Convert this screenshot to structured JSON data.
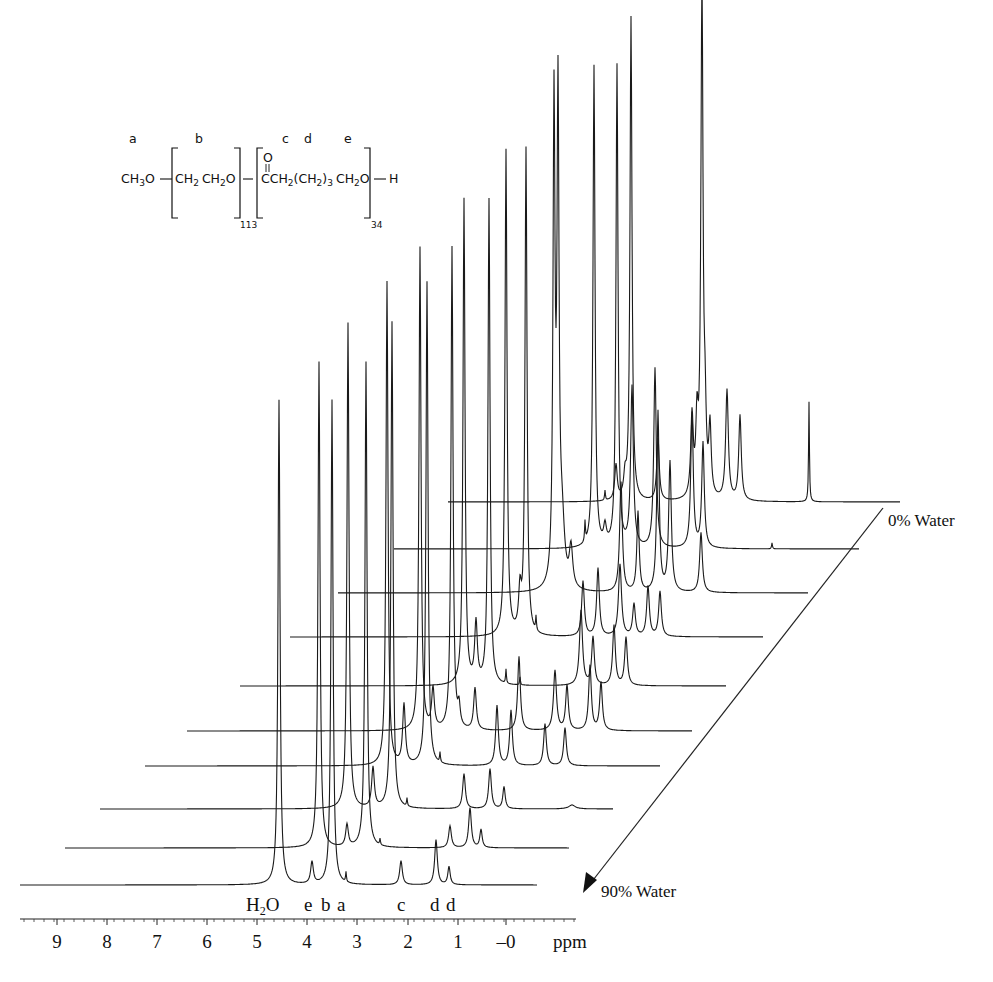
{
  "chart_data": {
    "type": "line",
    "subtype": "stacked-waterfall-nmr",
    "title": "",
    "xlabel": "ppm",
    "ylabel": "",
    "xlim": [
      9.75,
      -0.5
    ],
    "x_ticks": [
      9,
      8,
      7,
      6,
      5,
      4,
      3,
      2,
      1,
      0
    ],
    "x_tick_labels": [
      "9",
      "8",
      "7",
      "6",
      "5",
      "4",
      "3",
      "2",
      "1",
      "–0"
    ],
    "grid": false,
    "series_direction_label_top": "0% Water",
    "series_direction_label_bottom": "90% Water",
    "peak_assignments": [
      {
        "label": "H2O",
        "ppm": 4.6
      },
      {
        "label": "e",
        "ppm": 3.9
      },
      {
        "label": "b",
        "ppm": 3.6
      },
      {
        "label": "a",
        "ppm": 3.35
      },
      {
        "label": "c",
        "ppm": 2.2
      },
      {
        "label": "d",
        "ppm": 1.5
      },
      {
        "label": "d",
        "ppm": 1.3
      }
    ],
    "series": [
      {
        "name": "90% Water",
        "baseline": [
          20,
          885
        ],
        "end_x": 537,
        "peaks": [
          [
            279,
            485,
            1.2
          ],
          [
            312,
            22,
            1.6
          ],
          [
            332,
            485,
            1.2
          ],
          [
            346,
            10,
            0.5
          ],
          [
            401,
            24,
            1.6
          ],
          [
            436,
            45,
            1.6
          ],
          [
            449,
            18,
            1.4
          ]
        ]
      },
      {
        "name": "80% Water",
        "baseline": [
          65,
          848
        ],
        "end_x": 569,
        "peaks": [
          [
            319,
            486,
            1.2
          ],
          [
            347,
            22,
            1.6
          ],
          [
            366,
            486,
            1.2
          ],
          [
            380,
            6,
            0.5
          ],
          [
            450,
            22,
            1.6
          ],
          [
            470,
            40,
            1.6
          ],
          [
            481,
            18,
            1.4
          ]
        ]
      },
      {
        "name": "70% Water",
        "baseline": [
          100,
          809
        ],
        "end_x": 613,
        "peaks": [
          [
            348,
            486,
            1.2
          ],
          [
            373,
            40,
            1.6
          ],
          [
            392,
            487,
            1.2
          ],
          [
            407,
            8,
            0.5
          ],
          [
            464,
            35,
            1.6
          ],
          [
            490,
            40,
            1.6
          ],
          [
            504,
            22,
            1.4
          ],
          [
            572,
            4,
            4
          ]
        ]
      },
      {
        "name": "60% Water",
        "baseline": [
          145,
          766
        ],
        "end_x": 660,
        "peaks": [
          [
            387,
            484,
            1.2
          ],
          [
            404,
            60,
            1.6
          ],
          [
            427,
            484,
            1.2
          ],
          [
            440,
            10,
            0.5
          ],
          [
            497,
            60,
            1.6
          ],
          [
            511,
            55,
            1.6
          ],
          [
            545,
            42,
            1.6
          ],
          [
            565,
            38,
            1.6
          ]
        ]
      },
      {
        "name": "50% Water",
        "baseline": [
          187,
          731
        ],
        "end_x": 692,
        "peaks": [
          [
            420,
            483,
            1.2
          ],
          [
            433,
            40,
            1.6
          ],
          [
            452,
            483,
            1.2
          ],
          [
            459,
            20,
            1.4
          ],
          [
            475,
            42,
            1.6
          ],
          [
            519,
            74,
            1.6
          ],
          [
            555,
            60,
            1.8
          ],
          [
            567,
            45,
            1.6
          ],
          [
            590,
            65,
            1.6
          ],
          [
            601,
            48,
            1.6
          ]
        ]
      },
      {
        "name": "40% Water",
        "baseline": [
          240,
          686
        ],
        "end_x": 726,
        "peaks": [
          [
            464,
            486,
            1.2
          ],
          [
            476,
            60,
            1.6
          ],
          [
            489,
            486,
            1.2
          ],
          [
            506,
            14,
            0.5
          ],
          [
            520,
            8,
            0.5
          ],
          [
            581,
            75,
            1.8
          ],
          [
            593,
            48,
            1.6
          ],
          [
            614,
            60,
            1.6
          ],
          [
            626,
            48,
            1.6
          ]
        ]
      },
      {
        "name": "30% Water",
        "baseline": [
          290,
          637
        ],
        "end_x": 763,
        "peaks": [
          [
            506,
            486,
            1.2
          ],
          [
            520,
            40,
            1.6
          ],
          [
            526,
            486,
            1.2
          ],
          [
            536,
            14,
            0.5
          ],
          [
            583,
            55,
            1.6
          ],
          [
            598,
            68,
            1.6
          ],
          [
            620,
            72,
            1.8
          ],
          [
            634,
            32,
            1.6
          ],
          [
            648,
            50,
            1.6
          ],
          [
            660,
            45,
            1.6
          ]
        ]
      },
      {
        "name": "20% Water",
        "baseline": [
          338,
          593
        ],
        "end_x": 808,
        "peaks": [
          [
            554,
            476,
            1.2
          ],
          [
            558,
            476,
            1.2
          ],
          [
            562,
            60,
            3.0
          ],
          [
            571,
            40,
            2.0
          ],
          [
            621,
            110,
            1.6
          ],
          [
            638,
            80,
            1.4
          ],
          [
            658,
            180,
            1.4
          ],
          [
            670,
            130,
            1.6
          ],
          [
            701,
            60,
            1.6
          ]
        ]
      },
      {
        "name": "10% Water",
        "baseline": [
          394,
          549
        ],
        "end_x": 859,
        "peaks": [
          [
            594,
            482,
            1.2
          ],
          [
            617,
            482,
            1.2
          ],
          [
            585,
            20,
            0.5
          ],
          [
            605,
            18,
            1.6
          ],
          [
            632,
            160,
            1.6
          ],
          [
            655,
            180,
            1.5
          ],
          [
            692,
            135,
            1.5
          ],
          [
            703,
            105,
            1.5
          ],
          [
            772,
            6,
            0.5
          ]
        ]
      },
      {
        "name": "0% Water",
        "baseline": [
          448,
          502
        ],
        "end_x": 900,
        "peaks": [
          [
            631,
            484,
            1.2
          ],
          [
            702,
            483,
            1.2
          ],
          [
            605,
            10,
            0.5
          ],
          [
            616,
            35,
            1.5
          ],
          [
            625,
            20,
            1.5
          ],
          [
            658,
            62,
            1.5
          ],
          [
            692,
            80,
            1.5
          ],
          [
            697,
            70,
            1.4
          ],
          [
            701,
            40,
            1.4
          ],
          [
            705,
            70,
            1.4
          ],
          [
            710,
            68,
            1.4
          ],
          [
            727,
            110,
            1.6
          ],
          [
            740,
            85,
            1.5
          ],
          [
            809,
            100,
            0.5
          ]
        ]
      }
    ]
  },
  "structure": {
    "labels": {
      "a": "a",
      "b": "b",
      "c": "c",
      "d": "d",
      "e": "e"
    },
    "fragment1": "CH",
    "fragment1_sub": "3",
    "fragment1_tail": "O",
    "repeat1": "CH",
    "repeat1_sub": "2",
    "repeat1_b": "CH",
    "repeat1_b_sub": "2",
    "repeat1_tail": "O",
    "repeat1_n": "113",
    "carbonyl_o": "O",
    "repeat2_start": "CCH",
    "repeat2_sub1": "2",
    "repeat2_mid": "(CH",
    "repeat2_sub2": "2",
    "repeat2_close": ")",
    "repeat2_sub3": "3",
    "repeat2_end": "CH",
    "repeat2_sub4": "2",
    "repeat2_tail": "O",
    "repeat2_n": "34",
    "terminal": "H"
  },
  "axis": {
    "unit": "ppm",
    "ticks": [
      {
        "label": "9",
        "x": 57
      },
      {
        "label": "8",
        "x": 107
      },
      {
        "label": "7",
        "x": 157
      },
      {
        "label": "6",
        "x": 207
      },
      {
        "label": "5",
        "x": 257
      },
      {
        "label": "4",
        "x": 307
      },
      {
        "label": "3",
        "x": 357
      },
      {
        "label": "2",
        "x": 408
      },
      {
        "label": "1",
        "x": 458
      },
      {
        "label": "–0",
        "x": 506
      }
    ]
  },
  "assignment_labels": [
    {
      "text": "H",
      "x": 246
    },
    {
      "text": "e",
      "x": 304
    },
    {
      "text": "b",
      "x": 321
    },
    {
      "text": "a",
      "x": 337
    },
    {
      "text": "c",
      "x": 397
    },
    {
      "text": "d",
      "x": 430
    },
    {
      "text": "d",
      "x": 446
    }
  ],
  "water_labels": {
    "top": "0% Water",
    "bottom": "90% Water"
  }
}
